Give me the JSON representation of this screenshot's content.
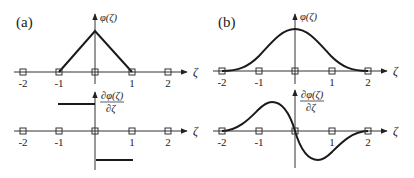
{
  "figure": {
    "panels": [
      {
        "id": "a",
        "label": "(a)",
        "top": {
          "ylabel": "φ(ζ)",
          "xlabel": "ζ",
          "description": "triangular (linear hat) basis function"
        },
        "bottom": {
          "ylabel_num": "∂φ(ζ)",
          "ylabel_den": "∂ζ",
          "xlabel": "ζ",
          "description": "piecewise constant derivative"
        },
        "ticks": [
          "-2",
          "-1",
          "",
          "1",
          "2"
        ]
      },
      {
        "id": "b",
        "label": "(b)",
        "top": {
          "ylabel": "φ(ζ)",
          "xlabel": "ζ",
          "description": "smooth bell-shaped (cubic B-spline) basis function"
        },
        "bottom": {
          "ylabel_num": "∂φ(ζ)",
          "ylabel_den": "∂ζ",
          "xlabel": "ζ",
          "description": "smooth derivative"
        },
        "ticks": [
          "-2",
          "-1",
          "",
          "1",
          "2"
        ]
      }
    ],
    "colors": {
      "ink": "#222222",
      "curve": "#1a1a1a",
      "background": "#ffffff"
    }
  }
}
